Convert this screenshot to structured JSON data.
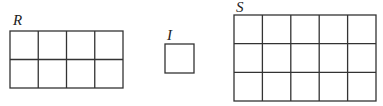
{
  "figures": [
    {
      "label": "R",
      "cols": 4,
      "rows": 2,
      "x": 10,
      "y": 31,
      "width": 113,
      "height": 57,
      "label_x": 13,
      "label_y": 13
    },
    {
      "label": "I",
      "cols": 1,
      "rows": 1,
      "x": 165,
      "y": 44,
      "width": 29,
      "height": 29,
      "label_x": 166,
      "label_y": 28
    },
    {
      "label": "S",
      "cols": 5,
      "rows": 3,
      "x": 234,
      "y": 15,
      "width": 142,
      "height": 86,
      "label_x": 236,
      "label_y": 0
    }
  ],
  "colors": {
    "stroke": "#333333",
    "label": "#222222",
    "background": "#ffffff"
  }
}
